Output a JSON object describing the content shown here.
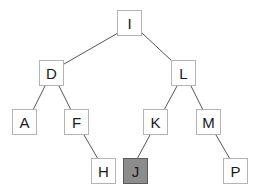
{
  "tree": {
    "highlight_color": "#8c8c8c",
    "nodes": [
      {
        "id": "I",
        "label": "I",
        "x": 117,
        "y": 10,
        "highlighted": false
      },
      {
        "id": "D",
        "label": "D",
        "x": 39,
        "y": 60,
        "highlighted": false
      },
      {
        "id": "L",
        "label": "L",
        "x": 171,
        "y": 60,
        "highlighted": false
      },
      {
        "id": "A",
        "label": "A",
        "x": 12,
        "y": 109,
        "highlighted": false
      },
      {
        "id": "F",
        "label": "F",
        "x": 64,
        "y": 109,
        "highlighted": false
      },
      {
        "id": "K",
        "label": "K",
        "x": 143,
        "y": 109,
        "highlighted": false
      },
      {
        "id": "M",
        "label": "M",
        "x": 196,
        "y": 109,
        "highlighted": false
      },
      {
        "id": "H",
        "label": "H",
        "x": 91,
        "y": 158,
        "highlighted": false
      },
      {
        "id": "J",
        "label": "J",
        "x": 123,
        "y": 158,
        "highlighted": true
      },
      {
        "id": "P",
        "label": "P",
        "x": 223,
        "y": 158,
        "highlighted": false
      }
    ],
    "edges": [
      {
        "from": "I",
        "to": "D"
      },
      {
        "from": "I",
        "to": "L"
      },
      {
        "from": "D",
        "to": "A"
      },
      {
        "from": "D",
        "to": "F"
      },
      {
        "from": "L",
        "to": "K"
      },
      {
        "from": "L",
        "to": "M"
      },
      {
        "from": "F",
        "to": "H"
      },
      {
        "from": "K",
        "to": "J"
      },
      {
        "from": "M",
        "to": "P"
      }
    ]
  }
}
